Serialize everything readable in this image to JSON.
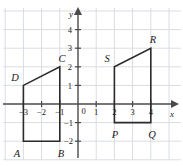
{
  "figure": {
    "axis_x_name": "x",
    "axis_y_name": "y",
    "colors": {
      "grid": "#d8dde2",
      "axis": "#4a4a4a",
      "shape": "#2b2b2b",
      "background": "#ffffff",
      "label": "#1a1a1a"
    }
  },
  "axes": {
    "x_ticks": [
      {
        "value": -3,
        "label": "−3"
      },
      {
        "value": -2,
        "label": "−2"
      },
      {
        "value": -1,
        "label": "−1"
      },
      {
        "value": 1,
        "label": "1"
      },
      {
        "value": 2,
        "label": "2"
      },
      {
        "value": 3,
        "label": "3"
      },
      {
        "value": 4,
        "label": "4"
      }
    ],
    "y_ticks": [
      {
        "value": 4,
        "label": "4"
      },
      {
        "value": 3,
        "label": "3"
      },
      {
        "value": 2,
        "label": "2"
      },
      {
        "value": 1,
        "label": "1"
      },
      {
        "value": -1,
        "label": "−1"
      },
      {
        "value": -2,
        "label": "−2"
      }
    ],
    "origin_label": "0",
    "xlim": [
      -4,
      5
    ],
    "ylim": [
      -3,
      5
    ]
  },
  "shapes": [
    {
      "name": "ABCD",
      "vertices": [
        {
          "label": "A",
          "x": -3,
          "y": -2
        },
        {
          "label": "B",
          "x": -1,
          "y": -2
        },
        {
          "label": "C",
          "x": -1,
          "y": 2
        },
        {
          "label": "D",
          "x": -3,
          "y": 1
        }
      ]
    },
    {
      "name": "PQRS",
      "vertices": [
        {
          "label": "P",
          "x": 2,
          "y": -1
        },
        {
          "label": "Q",
          "x": 4,
          "y": -1
        },
        {
          "label": "R",
          "x": 4,
          "y": 3
        },
        {
          "label": "S",
          "x": 2,
          "y": 2
        }
      ]
    }
  ],
  "vertex_labels": {
    "A": "A",
    "B": "B",
    "C": "C",
    "D": "D",
    "P": "P",
    "Q": "Q",
    "R": "R",
    "S": "S"
  },
  "tick_text": {
    "xm3": "−3",
    "xm2": "−2",
    "xm1": "−1",
    "x1": "1",
    "x2": "2",
    "x3": "3",
    "x4": "4",
    "y4": "4",
    "y3": "3",
    "y2": "2",
    "y1": "1",
    "ym1": "−1",
    "ym2": "−2",
    "zero": "0"
  }
}
